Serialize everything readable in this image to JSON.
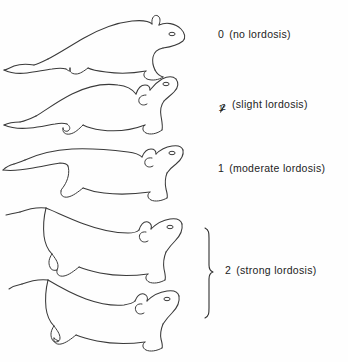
{
  "figure": {
    "background_color": "#fefefe",
    "line_color": "#3a3a3a",
    "text_color": "#222222",
    "width": 348,
    "height": 362
  },
  "labels": [
    {
      "id": "label-0",
      "score": "0",
      "description": "(no lordosis)",
      "full_text": "0  (no lordosis)"
    },
    {
      "id": "label-half",
      "score": "1/2",
      "numerator": "1",
      "denominator": "2",
      "description": "(slight lordosis)",
      "full_text": "1/2 (slight lordosis)"
    },
    {
      "id": "label-1",
      "score": "1",
      "description": "(moderate lordosis)",
      "full_text": "1  (moderate lordosis)"
    },
    {
      "id": "label-2",
      "score": "2",
      "description": "(strong lordosis)",
      "full_text": "2 (strong lordosis)"
    }
  ],
  "figures": [
    {
      "name": "rat-no-lordosis",
      "posture": "flat horizontal back, head level, tail extended left",
      "score": "0"
    },
    {
      "name": "rat-slight-lordosis",
      "posture": "slightly arched back, head raised, snout tilted up",
      "score": "1/2"
    },
    {
      "name": "rat-moderate-lordosis",
      "posture": "concave back, head lifted, rump raised",
      "score": "1"
    },
    {
      "name": "rat-strong-lordosis-upper",
      "posture": "deeply concave back, head strongly raised, tail elevated",
      "score": "2"
    },
    {
      "name": "rat-strong-lordosis-lower",
      "posture": "deeply concave back, crouched low, head raised",
      "score": "2"
    }
  ],
  "bracket": {
    "name": "brace-strong-lordosis",
    "spans": [
      "rat-strong-lordosis-upper",
      "rat-strong-lordosis-lower"
    ],
    "label_ref": "label-2"
  }
}
